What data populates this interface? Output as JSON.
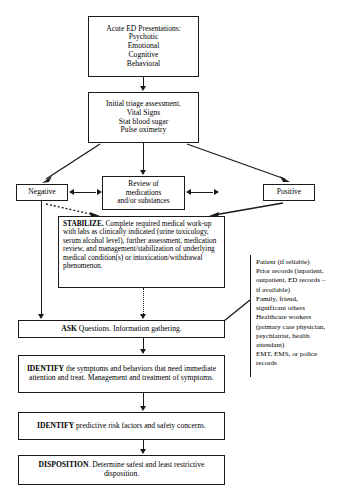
{
  "diagram": {
    "nodes": {
      "acute_presentations": {
        "lines": [
          "Acute ED Presentations:",
          "Psychotic",
          "Emotional",
          "Cognitive",
          "Behavioral"
        ]
      },
      "initial_triage": {
        "lines": [
          "Initial triage assessment.",
          "Vital Signs",
          "Stat blood sugar",
          "Pulse oximetry"
        ]
      },
      "review_medications": {
        "lines": [
          "Review of",
          "medications",
          "and/or substances"
        ]
      },
      "negative": {
        "label": "Negative"
      },
      "positive": {
        "label": "Positive"
      },
      "stabilize": {
        "emphasis": "STABILIZE.",
        "text": " Complete required medical work-up with labs as clinically indicated (urine toxicology, serum alcohol level), further assessment, medication review, and management/stabilization of underlying medical condition(s) or intoxication/withdrawal phenomenon."
      },
      "ask": {
        "emphasis": "ASK",
        "text": " Questions. Information gathering."
      },
      "identify_symptoms": {
        "emphasis": "IDENTIFY",
        "text": " the symptoms and behaviors that need immediate attention and treat. Management and treatment of symptoms."
      },
      "identify_risk": {
        "emphasis": "IDENTIFY",
        "text": " predictive risk factors and safety concerns."
      },
      "disposition": {
        "emphasis": "DISPOSITION",
        "text": ". Determine safest and least restrictive disposition."
      }
    },
    "information_sources": {
      "lines": [
        "Patient (if reliable)",
        "Prior records (inpatient,",
        "outpatient, ED records –",
        "if available)",
        "Family, friend,",
        "significant others",
        "Healthcare workers",
        "(primary care physician,",
        "psychiatrist, health",
        "attendant)",
        "EMT, EMS, or police",
        "records"
      ]
    },
    "colors": {
      "line": "#1a1a1a",
      "background": "#ffffff",
      "text": "#000000"
    }
  }
}
